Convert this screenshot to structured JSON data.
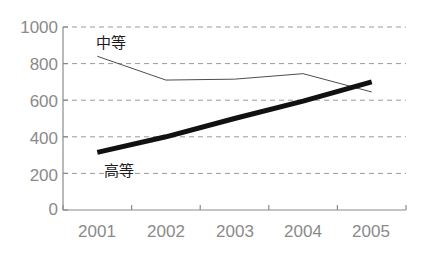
{
  "chart_data": {
    "type": "line",
    "title": "",
    "xlabel": "",
    "ylabel": "",
    "categories": [
      "2001",
      "2002",
      "2003",
      "2004",
      "2005"
    ],
    "x": [
      2001,
      2002,
      2003,
      2004,
      2005
    ],
    "ylim": [
      0,
      1000
    ],
    "yticks": [
      0,
      200,
      400,
      600,
      800,
      1000
    ],
    "xticks": [
      "2001",
      "2002",
      "2003",
      "2004",
      "2005"
    ],
    "grid": "horizontal-dashed",
    "legend": "inline-annotations",
    "series": [
      {
        "name": "中等",
        "values": [
          840,
          710,
          715,
          745,
          645
        ],
        "style": "thin",
        "color": "#4d4d4d",
        "width": 1
      },
      {
        "name": "高等",
        "values": [
          315,
          400,
          500,
          595,
          700
        ],
        "style": "thick",
        "color": "#111111",
        "width": 5
      }
    ],
    "annotations": [
      {
        "text": "中等",
        "x": 2001.45,
        "y": 905
      },
      {
        "text": "高等",
        "x": 2001.6,
        "y": 255
      }
    ]
  },
  "axis": {
    "y_labels": [
      "1000",
      "800",
      "600",
      "400",
      "200",
      "0"
    ],
    "x_labels": [
      "2001",
      "2002",
      "2003",
      "2004",
      "2005"
    ]
  },
  "colors": {
    "axis": "#8a8a8a",
    "grid": "#9a9a9a",
    "tick_text": "#8a8a8a",
    "series_thin": "#4d4d4d",
    "series_thick": "#111111",
    "background": "#ffffff"
  }
}
